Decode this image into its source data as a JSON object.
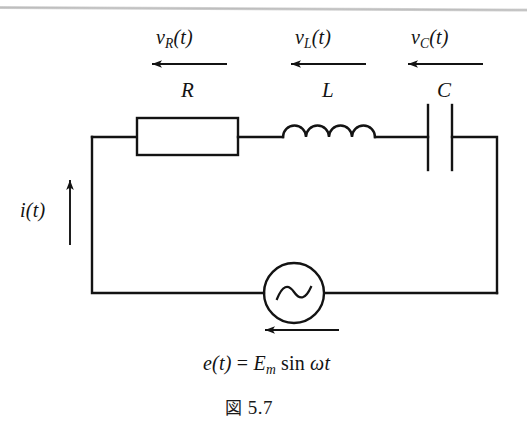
{
  "figure": {
    "type": "series-rlc-circuit-schematic",
    "caption_prefix": "図",
    "caption_number": "5.7",
    "caption_full": "図 5.7",
    "background_color": "#ffffff",
    "line_color": "#131313"
  },
  "labels": {
    "resistor_voltage": {
      "base": "v",
      "sub": "R",
      "suffix": "(t)",
      "full": "v_R(t)"
    },
    "inductor_voltage": {
      "base": "v",
      "sub": "L",
      "suffix": "(t)",
      "full": "v_L(t)"
    },
    "capacitor_voltage": {
      "base": "v",
      "sub": "C",
      "suffix": "(t)",
      "full": "v_C(t)"
    },
    "resistor_symbol": "R",
    "inductor_symbol": "L",
    "capacitor_symbol": "C",
    "current": {
      "base": "i",
      "suffix": "(t)",
      "full": "i(t)"
    },
    "source_equation": {
      "lhs": "e(t)",
      "equals": "=",
      "amplitude_base": "E",
      "amplitude_sub": "m",
      "sin": "sin",
      "omega_t": "ωt",
      "full": "e(t) = E_m sin ωt"
    }
  },
  "components": [
    {
      "name": "resistor",
      "symbol": "R",
      "voltage_label": "v_R(t)",
      "shape": "rectangle"
    },
    {
      "name": "inductor",
      "symbol": "L",
      "voltage_label": "v_L(t)",
      "shape": "coil-4-humps"
    },
    {
      "name": "capacitor",
      "symbol": "C",
      "voltage_label": "v_C(t)",
      "shape": "parallel-plates"
    },
    {
      "name": "ac-source",
      "symbol": "e(t)",
      "voltage_label": "e(t) = E_m sin ωt",
      "shape": "circle-with-sine"
    }
  ],
  "arrows": [
    {
      "name": "resistor-voltage-arrow",
      "direction": "left"
    },
    {
      "name": "inductor-voltage-arrow",
      "direction": "left"
    },
    {
      "name": "capacitor-voltage-arrow",
      "direction": "left"
    },
    {
      "name": "current-arrow",
      "direction": "up"
    },
    {
      "name": "source-voltage-arrow",
      "direction": "left"
    }
  ]
}
